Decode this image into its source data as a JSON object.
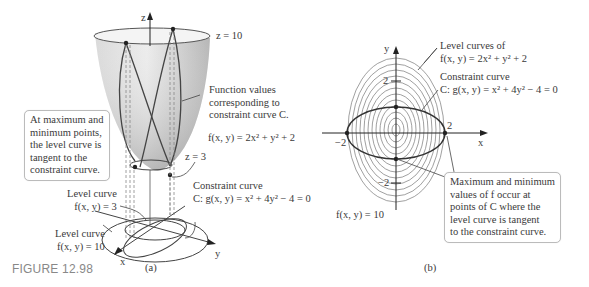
{
  "figure_label": "FIGURE 12.98",
  "panel_a": {
    "caption": "(a)",
    "axes": {
      "z": "z",
      "x": "x",
      "y": "y"
    },
    "labels": {
      "z10": "z = 10",
      "z3": "z = 3",
      "function_values": [
        "Function values",
        "corresponding to",
        "constraint curve C."
      ],
      "function": "f(x, y) = 2x² + y² + 2",
      "constraint_title": "Constraint curve",
      "constraint_eq": "C: g(x, y) = x² + 4y² − 4 = 0",
      "level3_title": "Level curve",
      "level3_eq": "f(x, y) = 3",
      "level10_title": "Level curve",
      "level10_eq": "f(x, y) = 10"
    },
    "callout": [
      "At maximum and",
      "minimum points,",
      "the level curve is",
      "tangent to the",
      "constraint curve."
    ]
  },
  "panel_b": {
    "caption": "(b)",
    "axes": {
      "x": "x",
      "y": "y"
    },
    "ticks": {
      "x_pos": "2",
      "x_neg": "−2",
      "y_pos": "2",
      "y_neg": "−2"
    },
    "labels": {
      "level_title": "Level curves of",
      "level_eq": "f(x, y) = 2x² + y² + 2",
      "constraint_title": "Constraint curve",
      "constraint_eq": "C: g(x, y) = x² + 4y² − 4 = 0",
      "f10": "f(x, y) = 10"
    },
    "callout": [
      "Maximum and minimum",
      "values of f occur at",
      "points of C where the",
      "level curve is tangent",
      "to the constraint curve."
    ]
  },
  "colors": {
    "surface": "#c8c8c8",
    "curve": "#4a4a4a",
    "box_border": "#bbbbbb",
    "figure_label": "#888888"
  }
}
